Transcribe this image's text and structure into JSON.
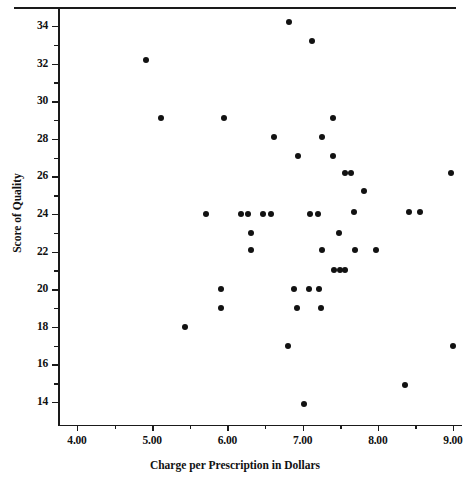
{
  "chart_data": {
    "type": "scatter",
    "title": "",
    "xlabel": "Charge per Prescription in Dollars",
    "ylabel": "Score of Quality",
    "xlim": [
      3.72,
      9.12
    ],
    "ylim": [
      12.8,
      34.9
    ],
    "xticks": [
      4.0,
      5.0,
      6.0,
      7.0,
      8.0,
      9.0
    ],
    "xticklabels": [
      "4.00",
      "5.00",
      "6.00",
      "7.00",
      "8.00",
      "9.00"
    ],
    "yticks": [
      14,
      16,
      18,
      20,
      22,
      24,
      26,
      28,
      30,
      32,
      34
    ],
    "yticklabels": [
      "14",
      "16",
      "18",
      "20",
      "22",
      "24",
      "26",
      "28",
      "30",
      "32",
      "34"
    ],
    "x_minor_ticks": [
      4.5,
      5.5,
      6.5,
      7.5,
      8.5
    ],
    "y_minor_ticks": [
      15,
      17,
      19,
      21,
      23,
      25,
      27,
      29,
      31,
      33
    ],
    "grid": false,
    "legend": null,
    "marker": "filled-circle",
    "marker_color": "#121212",
    "marker_size_px": 6,
    "points": [
      [
        4.92,
        32.2
      ],
      [
        5.12,
        29.1
      ],
      [
        5.44,
        18.0
      ],
      [
        5.92,
        20.0
      ],
      [
        5.92,
        19.0
      ],
      [
        5.96,
        29.1
      ],
      [
        5.72,
        24.0
      ],
      [
        6.18,
        24.0
      ],
      [
        6.28,
        24.0
      ],
      [
        6.32,
        23.0
      ],
      [
        6.32,
        22.1
      ],
      [
        6.48,
        24.0
      ],
      [
        6.58,
        24.0
      ],
      [
        6.62,
        28.1
      ],
      [
        6.8,
        17.0
      ],
      [
        6.82,
        34.2
      ],
      [
        6.88,
        20.0
      ],
      [
        6.92,
        19.0
      ],
      [
        6.94,
        27.1
      ],
      [
        7.02,
        13.9
      ],
      [
        7.08,
        20.0
      ],
      [
        7.1,
        24.0
      ],
      [
        7.12,
        33.2
      ],
      [
        7.2,
        24.0
      ],
      [
        7.22,
        20.0
      ],
      [
        7.24,
        19.0
      ],
      [
        7.26,
        28.1
      ],
      [
        7.26,
        22.1
      ],
      [
        7.4,
        29.1
      ],
      [
        7.4,
        27.1
      ],
      [
        7.42,
        21.0
      ],
      [
        7.48,
        23.0
      ],
      [
        7.5,
        21.0
      ],
      [
        7.56,
        21.0
      ],
      [
        7.56,
        26.2
      ],
      [
        7.64,
        26.2
      ],
      [
        7.68,
        24.1
      ],
      [
        7.7,
        22.1
      ],
      [
        7.82,
        25.2
      ],
      [
        7.98,
        22.1
      ],
      [
        8.36,
        14.9
      ],
      [
        8.42,
        24.1
      ],
      [
        8.56,
        24.1
      ],
      [
        8.98,
        26.2
      ],
      [
        9.0,
        17.0
      ]
    ]
  },
  "figure": {
    "top_rule_color": "#1a1a1a",
    "axis_color": "#1a1a1a",
    "background": "#ffffff"
  }
}
